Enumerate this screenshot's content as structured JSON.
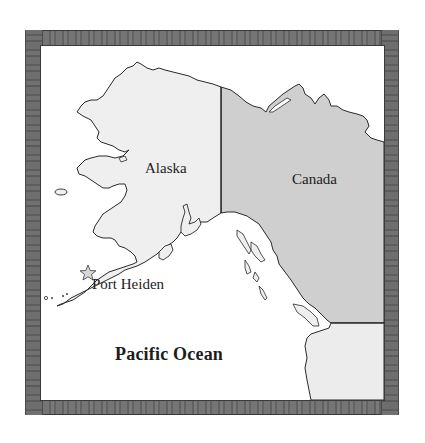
{
  "map": {
    "title": "",
    "labels": {
      "alaska": "Alaska",
      "canada": "Canada",
      "port_heiden": "Port Heiden",
      "pacific_ocean": "Pacific Ocean"
    },
    "markers": [
      {
        "name": "Port Heiden",
        "icon": "star-icon"
      }
    ],
    "colors": {
      "alaska_fill": "#efefef",
      "canada_fill": "#cfcfcf",
      "usa_fill": "#ececec",
      "ocean_fill": "#ffffff",
      "coastline": "#2a2a2a",
      "frame": "#6a6a6a"
    }
  }
}
